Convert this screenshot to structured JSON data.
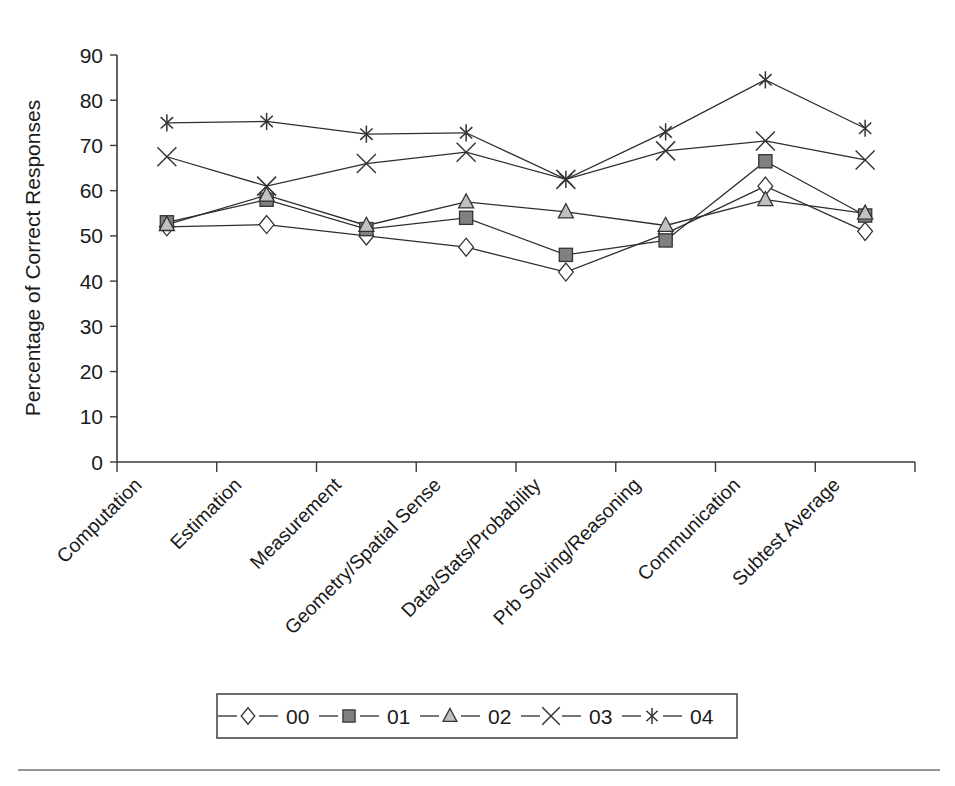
{
  "chart_data": {
    "type": "line",
    "title": "",
    "xlabel": "",
    "ylabel": "Percentage of Correct Responses",
    "ylim": [
      0,
      90
    ],
    "yticks": [
      0,
      10,
      20,
      30,
      40,
      50,
      60,
      70,
      80,
      90
    ],
    "grid": false,
    "legend_position": "bottom",
    "categories": [
      "Computation",
      "Estimation",
      "Measurement",
      "Geometry/Spatial Sense",
      "Data/Stats/Probability",
      "Prb Solving/Reasoning",
      "Communication",
      "Subtest Average"
    ],
    "series": [
      {
        "name": "00",
        "marker": "diamond",
        "values": [
          52,
          52.5,
          50,
          47.5,
          42,
          50.5,
          61,
          51
        ]
      },
      {
        "name": "01",
        "marker": "square",
        "values": [
          53,
          58,
          51.5,
          54,
          45.8,
          49,
          66.5,
          54.5
        ]
      },
      {
        "name": "02",
        "marker": "triangle",
        "values": [
          52.5,
          59,
          52.3,
          57.5,
          55.3,
          52.3,
          58,
          55
        ]
      },
      {
        "name": "03",
        "marker": "cross",
        "values": [
          67.5,
          61,
          66,
          68.5,
          62.5,
          68.8,
          71,
          66.8
        ]
      },
      {
        "name": "04",
        "marker": "asterisk",
        "values": [
          75,
          75.3,
          72.5,
          72.8,
          62.5,
          73,
          84.5,
          73.8
        ]
      }
    ],
    "colors": {
      "line": "#2e2e2e",
      "marker_stroke": "#333333",
      "marker_fill_00": "#ffffff",
      "marker_fill_01": "#808080",
      "marker_fill_02": "#c0c0c0",
      "axis": "#3a3a3a",
      "background": "#ffffff"
    }
  },
  "legend": {
    "entries": [
      {
        "label": "00",
        "marker": "diamond"
      },
      {
        "label": "01",
        "marker": "square"
      },
      {
        "label": "02",
        "marker": "triangle"
      },
      {
        "label": "03",
        "marker": "cross"
      },
      {
        "label": "04",
        "marker": "asterisk"
      }
    ]
  }
}
